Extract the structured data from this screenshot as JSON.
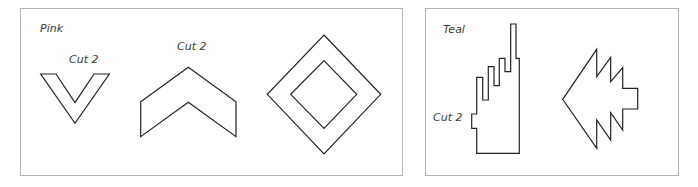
{
  "panels": [
    {
      "id": "pink",
      "title": "Pink",
      "shapes": [
        {
          "name": "v-shape",
          "label": "Cut 2"
        },
        {
          "name": "chevron",
          "label": "Cut 2"
        },
        {
          "name": "diamond-frame",
          "label": ""
        }
      ]
    },
    {
      "id": "teal",
      "title": "Teal",
      "shapes": [
        {
          "name": "stepped-tower",
          "label": "Cut 2"
        },
        {
          "name": "tree-arrow",
          "label": ""
        }
      ]
    }
  ],
  "colors": {
    "outline": "#222222",
    "panel_border": "#b4b4b4",
    "label_text": "#3a3a3a",
    "background": "#ffffff"
  }
}
